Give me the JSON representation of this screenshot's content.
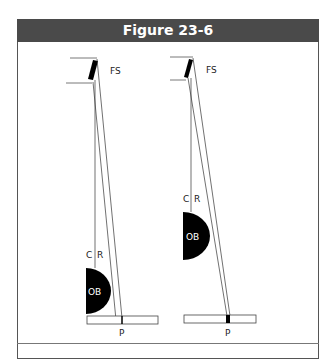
{
  "figure": {
    "title": "Figure 23-6",
    "colors": {
      "header_bg": "#4a4a4a",
      "header_text": "#ffffff",
      "ink": "#000000"
    }
  },
  "diagrams": [
    {
      "name": "left",
      "labels": {
        "fs": "FS",
        "c": "C",
        "r": "R",
        "ob": "OB",
        "p": "P"
      }
    },
    {
      "name": "right",
      "labels": {
        "fs": "FS",
        "c": "C",
        "r": "R",
        "ob": "OB",
        "p": "P"
      }
    }
  ]
}
